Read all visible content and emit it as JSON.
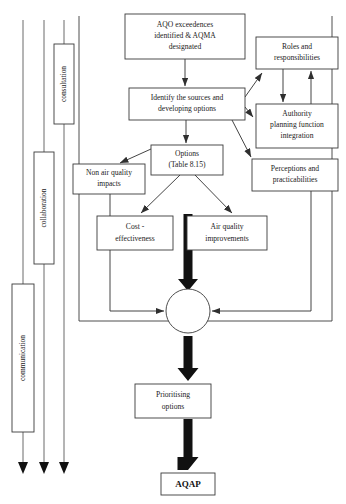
{
  "diagram": {
    "colors": {
      "box_stroke": "#3a3a3a",
      "line": "#2f2f2f",
      "lane_line": "#6b6b6b",
      "thick_arrow": "#111111",
      "background": "#ffffff"
    },
    "lanes": [
      {
        "id": "consultation",
        "label": "consultation",
        "x": 54,
        "y": 44,
        "w": 20,
        "h": 80
      },
      {
        "id": "collaboration",
        "label": "collaboration",
        "x": 34,
        "y": 152,
        "w": 20,
        "h": 112
      },
      {
        "id": "communication",
        "label": "communication",
        "x": 12,
        "y": 284,
        "w": 22,
        "h": 148
      }
    ],
    "nodes": [
      {
        "id": "aqo-exceedences",
        "lines": [
          "AQO  exceedences",
          "identified & AQMA",
          "designated"
        ],
        "x": 125,
        "y": 14,
        "w": 120,
        "h": 45
      },
      {
        "id": "roles-responsibilities",
        "lines": [
          "Roles and",
          "responsibilities"
        ],
        "x": 256,
        "y": 37,
        "w": 82,
        "h": 32
      },
      {
        "id": "identify-sources",
        "lines": [
          "Identify the sources and",
          "developing options"
        ],
        "x": 129,
        "y": 88,
        "w": 116,
        "h": 32
      },
      {
        "id": "authority-planning",
        "lines": [
          "Authority",
          "planning function",
          "integration"
        ],
        "x": 256,
        "y": 104,
        "w": 82,
        "h": 44
      },
      {
        "id": "options",
        "lines": [
          "Options",
          "(Table 8.15)"
        ],
        "x": 151,
        "y": 145,
        "w": 72,
        "h": 30
      },
      {
        "id": "non-air-quality-impacts",
        "lines": [
          "Non air quality",
          "impacts"
        ],
        "x": 73,
        "y": 164,
        "w": 72,
        "h": 30
      },
      {
        "id": "perceptions-practicabilities",
        "lines": [
          "Perceptions and",
          "practicabilities"
        ],
        "x": 252,
        "y": 159,
        "w": 86,
        "h": 32
      },
      {
        "id": "cost-effectiveness",
        "lines": [
          "Cost -",
          "effectiveness"
        ],
        "x": 97,
        "y": 216,
        "w": 76,
        "h": 34
      },
      {
        "id": "air-quality-improvements",
        "lines": [
          "Air quality",
          "improvements"
        ],
        "x": 187,
        "y": 216,
        "w": 80,
        "h": 34
      },
      {
        "id": "prioritising-options",
        "lines": [
          "Prioritising",
          "options"
        ],
        "x": 135,
        "y": 384,
        "w": 76,
        "h": 34
      },
      {
        "id": "aqap",
        "lines": [
          "AQAP"
        ],
        "x": 161,
        "y": 473,
        "w": 54,
        "h": 22,
        "bold": true
      }
    ],
    "junction": {
      "id": "merge-junction",
      "cx": 188,
      "cy": 311,
      "r": 22
    },
    "outer_frame": {
      "x": 79,
      "y": 16,
      "w": 253,
      "h": 305
    }
  }
}
